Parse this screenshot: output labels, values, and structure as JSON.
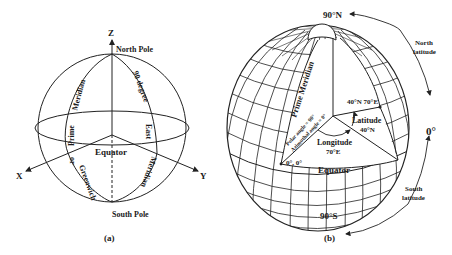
{
  "figure_a": {
    "caption": "(a)",
    "axis_z": "Z",
    "axis_x": "X",
    "axis_y": "Y",
    "north_pole": "North Pole",
    "south_pole": "South Pole",
    "equator": "Equator",
    "prime_meridian_text": [
      "Meridian",
      "Prime",
      "or",
      "Greenwich"
    ],
    "east_meridian_text": [
      "90 degree",
      "East",
      "Meridian"
    ]
  },
  "figure_b": {
    "caption": "(b)",
    "north_pole_label": "90°N",
    "south_pole_label": "90°S",
    "zero_label": "0°",
    "north_latitude": [
      "North",
      "latitude"
    ],
    "south_latitude": [
      "South",
      "latitude"
    ],
    "prime_meridian": "Prime Meridian",
    "point_label": "40°N 70°E",
    "latitude_label": "Latitude",
    "latitude_value": "40°N",
    "longitude_label": "Longitude",
    "longitude_value": "70°E",
    "origin_label": "0°, 0°",
    "equator": "Equator",
    "polar_angle": "Polar angle = 90°",
    "azimuthal_angle": "Azimuthal angle = 0°"
  },
  "colors": {
    "line": "#222222",
    "text": "#1a1a1a",
    "background": "#ffffff"
  }
}
